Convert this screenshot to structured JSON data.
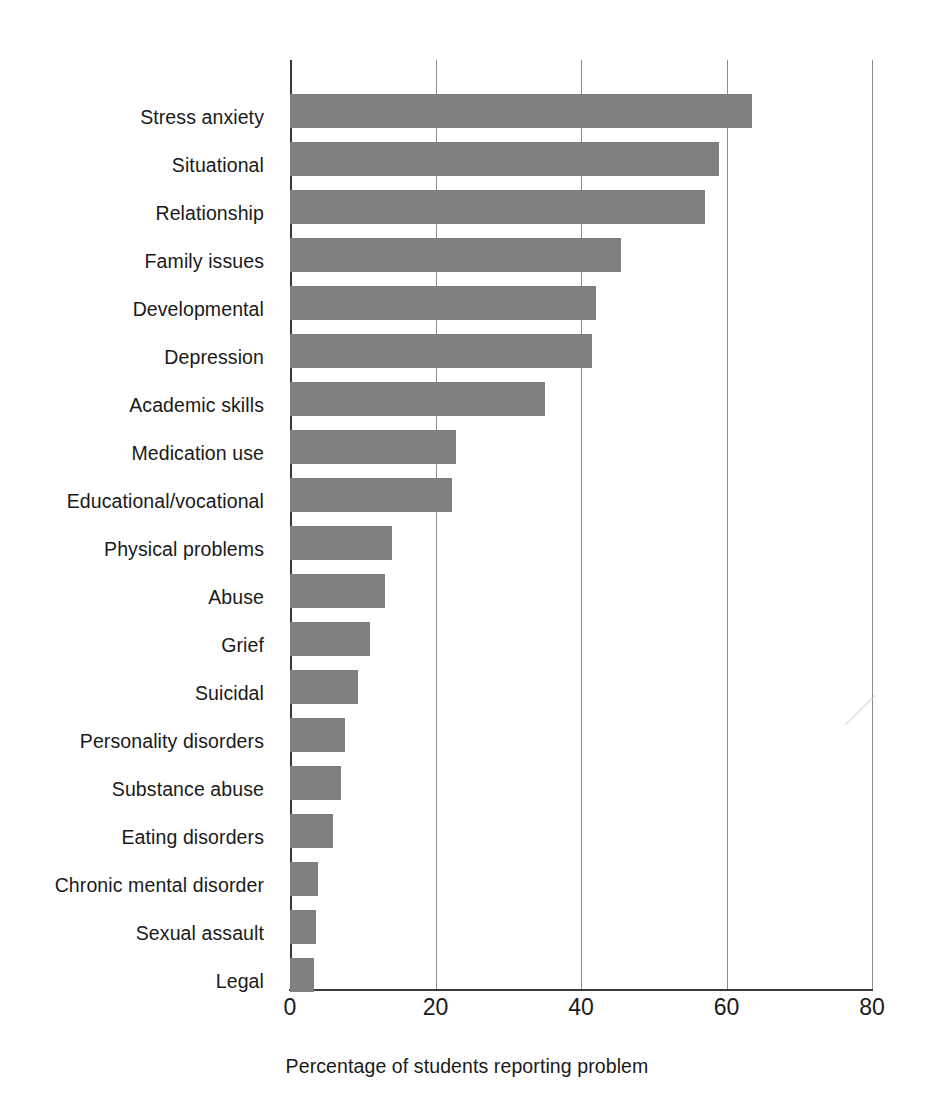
{
  "chart_data": {
    "type": "bar",
    "orientation": "horizontal",
    "title": "",
    "subtitle": "",
    "xlabel": "Percentage of students reporting problem",
    "ylabel": "",
    "xlim": [
      0,
      80
    ],
    "xticks": [
      0,
      20,
      40,
      60,
      80
    ],
    "xtick_labels": [
      "0",
      "20",
      "40",
      "60",
      "80"
    ],
    "grid": "vertical",
    "legend": "none",
    "bar_color": "#7f7f7f",
    "axis_color": "#3a3a3a",
    "gridline_color": "#8c8c8c",
    "categories": [
      "Stress anxiety",
      "Situational",
      "Relationship",
      "Family issues",
      "Developmental",
      "Depression",
      "Academic skills",
      "Medication use",
      "Educational/vocational",
      "Physical problems",
      "Abuse",
      "Grief",
      "Suicidal",
      "Personality disorders",
      "Substance abuse",
      "Eating disorders",
      "Chronic mental disorder",
      "Sexual assault",
      "Legal"
    ],
    "values": [
      63.5,
      59,
      57,
      45.5,
      42,
      41.5,
      35,
      22.8,
      22.3,
      14,
      13,
      11,
      9.3,
      7.6,
      7,
      5.9,
      3.8,
      3.6,
      3.3
    ]
  },
  "axis": {
    "x_title": "Percentage of students reporting problem",
    "ticks": [
      {
        "value": 0,
        "label": "0"
      },
      {
        "value": 20,
        "label": "20"
      },
      {
        "value": 40,
        "label": "40"
      },
      {
        "value": 60,
        "label": "60"
      },
      {
        "value": 80,
        "label": "80"
      }
    ]
  }
}
